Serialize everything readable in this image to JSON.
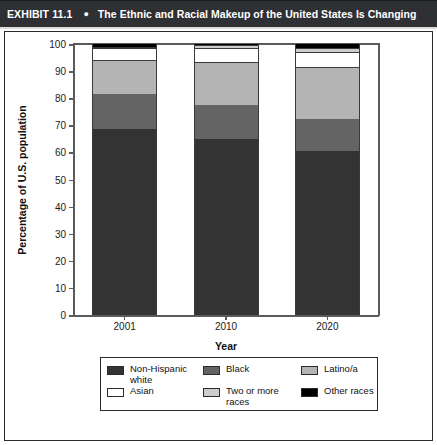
{
  "header": {
    "exhibit_label": "EXHIBIT 11.1",
    "bullet_icon": "bullet-dot",
    "title": "The Ethnic and Racial Makeup of the United States Is Changing"
  },
  "chart_data": {
    "type": "bar",
    "subtype": "stacked-bar-100",
    "title": "The Ethnic and Racial Makeup of the United States Is Changing",
    "xlabel": "Year",
    "ylabel": "Percentage of U.S. population",
    "categories": [
      "2001",
      "2010",
      "2020"
    ],
    "ylim": [
      0,
      100
    ],
    "yticks": [
      0,
      10,
      20,
      30,
      40,
      50,
      60,
      70,
      80,
      90,
      100
    ],
    "ytick_labels": [
      "0",
      "10",
      "20",
      "30",
      "40",
      "50",
      "60",
      "70",
      "80",
      "90",
      "100"
    ],
    "grid": false,
    "legend_position": "bottom",
    "series": [
      {
        "name": "Non-Hispanic white",
        "color": "#333333",
        "values": [
          68.5,
          65.0,
          60.5
        ]
      },
      {
        "name": "Black",
        "color": "#646464",
        "values": [
          13.0,
          12.5,
          12.0
        ]
      },
      {
        "name": "Latino/a",
        "color": "#b4b4b4",
        "values": [
          12.5,
          16.0,
          19.0
        ]
      },
      {
        "name": "Asian",
        "color": "#ffffff",
        "values": [
          4.5,
          5.0,
          5.5
        ]
      },
      {
        "name": "Two or more races",
        "color": "#cdcdcd",
        "values": [
          0.5,
          1.0,
          1.5
        ]
      },
      {
        "name": "Other races",
        "color": "#000000",
        "values": [
          1.0,
          0.5,
          1.5
        ]
      }
    ],
    "cumulative_tops": [
      [
        68.5,
        81.5,
        94.0,
        98.5,
        99.0,
        100.0
      ],
      [
        65.0,
        77.5,
        93.5,
        98.5,
        99.5,
        100.0
      ],
      [
        60.5,
        72.5,
        91.5,
        97.0,
        98.5,
        100.0
      ]
    ]
  },
  "legend": {
    "items": [
      {
        "label": "Non-Hispanic\nwhite",
        "color": "#333333"
      },
      {
        "label": "Black",
        "color": "#646464"
      },
      {
        "label": "Latino/a",
        "color": "#b4b4b4"
      },
      {
        "label": "Asian",
        "color": "#ffffff"
      },
      {
        "label": "Two or more\nraces",
        "color": "#cdcdcd"
      },
      {
        "label": "Other races",
        "color": "#000000"
      }
    ]
  }
}
